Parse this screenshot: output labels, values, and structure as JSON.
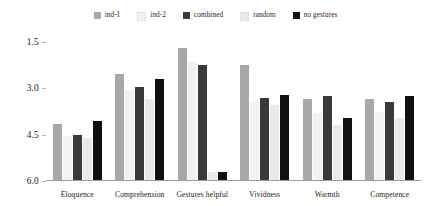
{
  "chart_data": {
    "type": "bar",
    "title": "",
    "subtitle": "",
    "xlabel": "",
    "ylabel": "",
    "grid": false,
    "legend_position": "top-center",
    "y_axis_inverted": true,
    "ylim": [
      6.0,
      1.5
    ],
    "ytick_labels": [
      "1.5",
      "3.0",
      "4.5",
      "6.0"
    ],
    "ytick_values": [
      1.5,
      3.0,
      4.5,
      6.0
    ],
    "categories": [
      "Eloquence",
      "Comprehension",
      "Gestures helpful",
      "Vividness",
      "Warmth",
      "Competence"
    ],
    "series": [
      {
        "name": "ind-1",
        "color": "#a8a8a8",
        "values": [
          4.15,
          2.55,
          1.7,
          2.25,
          3.35,
          3.35
        ]
      },
      {
        "name": "ind-2",
        "color": "#f2f2f2",
        "values": [
          4.55,
          3.05,
          2.15,
          3.45,
          3.8,
          3.75
        ]
      },
      {
        "name": "combined",
        "color": "#3a3a3a",
        "values": [
          4.5,
          2.95,
          2.25,
          3.3,
          3.25,
          3.45
        ]
      },
      {
        "name": "random",
        "color": "#eaeaea",
        "values": [
          4.6,
          3.35,
          5.7,
          3.55,
          4.2,
          3.95
        ]
      },
      {
        "name": "no gestures",
        "color": "#111111",
        "values": [
          4.05,
          2.7,
          5.7,
          3.2,
          3.95,
          3.25
        ]
      }
    ]
  },
  "legend": {
    "items": [
      {
        "label": "ind-1",
        "color": "#a8a8a8"
      },
      {
        "label": "ind-2",
        "color": "#f2f2f2"
      },
      {
        "label": "combined",
        "color": "#3a3a3a"
      },
      {
        "label": "random",
        "color": "#eaeaea"
      },
      {
        "label": "no gestures",
        "color": "#111111"
      }
    ]
  },
  "colors": {
    "background": "#ffffff",
    "axis": "#9a9a9a",
    "text": "#1a1a1a"
  }
}
